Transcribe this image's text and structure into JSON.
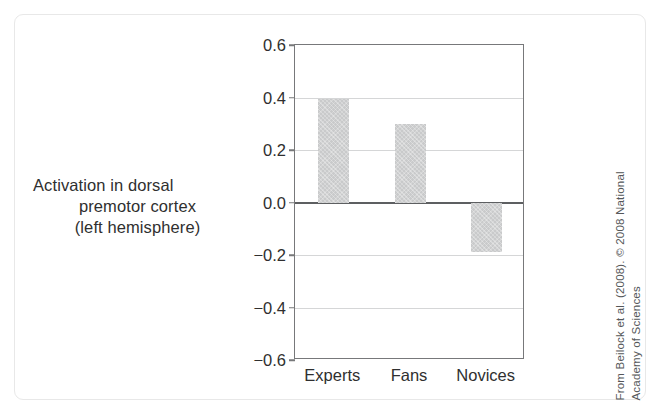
{
  "figure": {
    "y_axis_caption_lines": [
      "Activation in dorsal",
      "premotor cortex",
      "(left hemisphere)"
    ],
    "credit_lines": [
      "From Beilock et al. (2008). © 2008 National",
      "Academy of Sciences"
    ],
    "colors": {
      "bar_fill": "#c9cacb",
      "frame": "#77787a",
      "gridline": "#d5d6d7",
      "zero_line": "#5d5f61",
      "text": "#2f2f2f",
      "card_border": "#e8e8e8",
      "background": "#ffffff"
    }
  },
  "chart_data": {
    "type": "bar",
    "title": "",
    "xlabel": "",
    "ylabel": "Activation in dorsal premotor cortex (left hemisphere)",
    "categories": [
      "Experts",
      "Fans",
      "Novices"
    ],
    "values": [
      0.395,
      0.3,
      -0.19
    ],
    "ylim": [
      -0.6,
      0.6
    ],
    "yticks": [
      0.6,
      0.4,
      0.2,
      0.0,
      -0.2,
      -0.4,
      -0.6
    ],
    "ytick_labels": [
      "0.6",
      "0.4",
      "0.2",
      "0.0",
      "-0.2",
      "-0.4",
      "-0.6"
    ],
    "grid": true,
    "zero_line": 0.0,
    "legend": null,
    "series": [
      {
        "name": "Activation",
        "values": [
          0.395,
          0.3,
          -0.19
        ]
      }
    ]
  }
}
